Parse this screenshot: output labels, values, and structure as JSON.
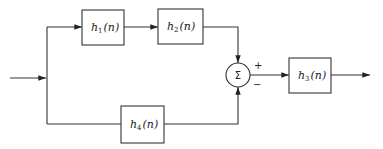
{
  "diagram": {
    "type": "block-diagram",
    "blocks": [
      {
        "id": "h1",
        "name": "h",
        "sub": "1",
        "arg": "(n)"
      },
      {
        "id": "h2",
        "name": "h",
        "sub": "2",
        "arg": "(n)"
      },
      {
        "id": "h3",
        "name": "h",
        "sub": "3",
        "arg": "(n)"
      },
      {
        "id": "h4",
        "name": "h",
        "sub": "4",
        "arg": "(n)"
      }
    ],
    "summer": {
      "symbol": "Σ",
      "plus": "+",
      "minus": "−"
    },
    "connections": [
      "input → split",
      "split → h1 → h2 → Σ(+)",
      "split → h4 → Σ(−)",
      "Σ → h3 → output"
    ]
  }
}
